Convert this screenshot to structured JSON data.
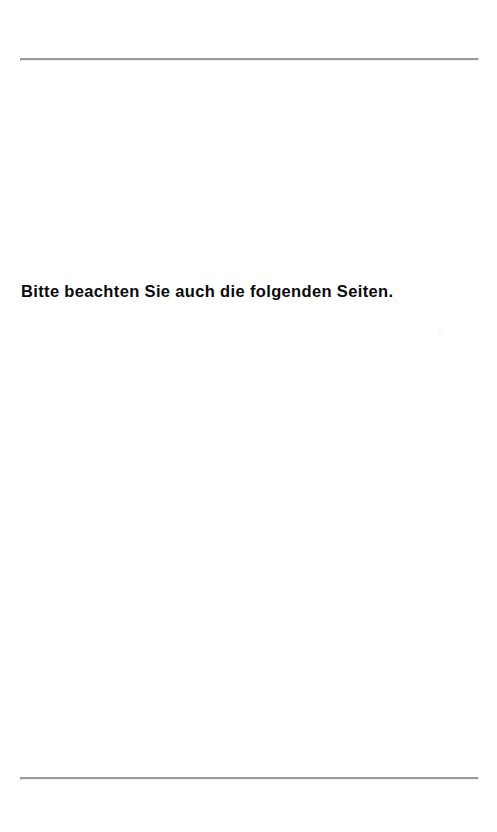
{
  "page": {
    "width": 497,
    "height": 832,
    "background_color": "#ffffff",
    "kind": "scanned-document-page"
  },
  "rules": {
    "color": "#9c9c9c",
    "top": {
      "name": "header-rule"
    },
    "bottom": {
      "name": "footer-rule"
    }
  },
  "body": {
    "notice": "Bitte beachten Sie auch die folgenden Seiten.",
    "text_color": "#0b0b0b"
  },
  "artifacts": {
    "speck": ""
  }
}
